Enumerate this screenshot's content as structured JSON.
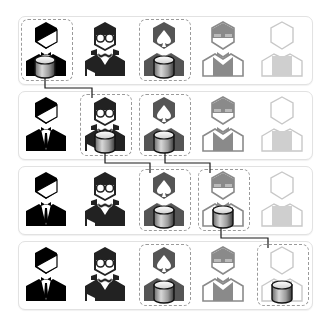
{
  "diagram": {
    "title": "",
    "persons": [
      {
        "id": "p1",
        "label": "man-in-suit",
        "color": "#000000"
      },
      {
        "id": "p2",
        "label": "woman-with-glasses",
        "color": "#222222"
      },
      {
        "id": "p3",
        "label": "person-with-spade",
        "color": "#555555"
      },
      {
        "id": "p4",
        "label": "person-with-visor",
        "color": "#8a8a8a"
      },
      {
        "id": "p5",
        "label": "blank-person",
        "color": "#c8c8c8"
      }
    ],
    "rows": [
      {
        "index": 1,
        "highlighted": [
          0,
          2
        ],
        "database_at": [
          0,
          2
        ]
      },
      {
        "index": 2,
        "highlighted": [
          1,
          2
        ],
        "database_at": [
          1,
          2
        ]
      },
      {
        "index": 3,
        "highlighted": [
          2,
          3
        ],
        "database_at": [
          2,
          3
        ]
      },
      {
        "index": 4,
        "highlighted": [
          2,
          4
        ],
        "database_at": [
          2,
          4
        ]
      }
    ],
    "connectors": [
      {
        "from": "row1-col1",
        "to": "row2-col2"
      },
      {
        "from": "row2-col2",
        "to": "row3-col3"
      },
      {
        "from": "row2-col3",
        "to": "row3-col4"
      },
      {
        "from": "row3-col4",
        "to": "row4-col5"
      }
    ],
    "icon_names": {
      "database": "database-icon",
      "person": "person-icon"
    },
    "colors": {
      "frame_border": "#e2e2e2",
      "highlight_border": "#9a9a9a",
      "connector": "#1a1a1a"
    }
  }
}
